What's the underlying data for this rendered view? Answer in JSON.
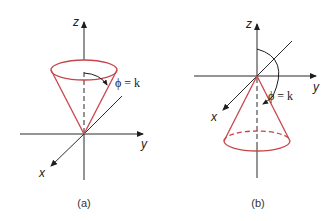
{
  "figure": {
    "colors": {
      "cone": "#c8454a",
      "axis": "#2b2b2b",
      "background": "#ffffff"
    },
    "panels": [
      {
        "caption": "(a)",
        "axes": {
          "x_label": "x",
          "y_label": "y",
          "z_label": "z"
        },
        "cone_orientation": "opening upward (apex at origin)",
        "angle_label": "ϕ = k"
      },
      {
        "caption": "(b)",
        "axes": {
          "x_label": "x",
          "y_label": "y",
          "z_label": "z"
        },
        "cone_orientation": "opening downward (apex at origin)",
        "angle_label": "ϕ = k"
      }
    ]
  }
}
